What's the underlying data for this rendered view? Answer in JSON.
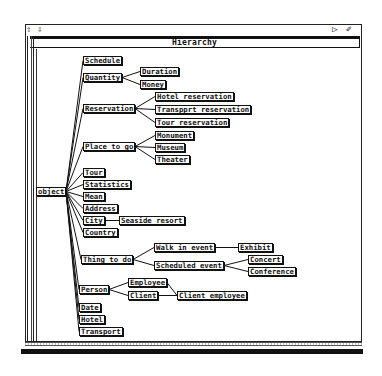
{
  "window": {
    "title": "Hierarchy",
    "top_icons": {
      "scroll_up": "up-arrow-icon",
      "scroll_down": "down-arrow-icon",
      "pointer": "pointer-icon",
      "pen": "pen-icon"
    }
  },
  "tree": {
    "root": "object",
    "nodes": [
      {
        "id": "object",
        "label": "object",
        "x": 36,
        "y": 187
      },
      {
        "id": "schedule",
        "label": "Schedule",
        "x": 83,
        "y": 56
      },
      {
        "id": "quantity",
        "label": "Quantity",
        "x": 83,
        "y": 73
      },
      {
        "id": "duration",
        "label": "Duration",
        "x": 140,
        "y": 67
      },
      {
        "id": "money",
        "label": "Money",
        "x": 140,
        "y": 80
      },
      {
        "id": "reservation",
        "label": "Reservation",
        "x": 83,
        "y": 104
      },
      {
        "id": "hotel_res",
        "label": "Hotel_reservation",
        "x": 155,
        "y": 92
      },
      {
        "id": "transport_res",
        "label": "Transpprt_reservation",
        "x": 155,
        "y": 105
      },
      {
        "id": "tour_res",
        "label": "Tour_reservation",
        "x": 155,
        "y": 118
      },
      {
        "id": "place_to_go",
        "label": "Place_to_go",
        "x": 83,
        "y": 142
      },
      {
        "id": "monument",
        "label": "Monument",
        "x": 155,
        "y": 131
      },
      {
        "id": "museum",
        "label": "Museum",
        "x": 155,
        "y": 143
      },
      {
        "id": "theater",
        "label": "Theater",
        "x": 155,
        "y": 155
      },
      {
        "id": "tour",
        "label": "Tour",
        "x": 83,
        "y": 168
      },
      {
        "id": "statistics",
        "label": "Statistics",
        "x": 83,
        "y": 180
      },
      {
        "id": "mean",
        "label": "Mean",
        "x": 83,
        "y": 192
      },
      {
        "id": "address",
        "label": "Address",
        "x": 83,
        "y": 204
      },
      {
        "id": "city",
        "label": "City",
        "x": 83,
        "y": 216
      },
      {
        "id": "seaside_resort",
        "label": "Seaside_resort",
        "x": 119,
        "y": 216
      },
      {
        "id": "country",
        "label": "Country",
        "x": 83,
        "y": 228
      },
      {
        "id": "thing_to_do",
        "label": "Thing_to_do",
        "x": 81,
        "y": 255
      },
      {
        "id": "walk_in_event",
        "label": "Walk_in_event",
        "x": 154,
        "y": 243
      },
      {
        "id": "exhibit",
        "label": "Exhibit",
        "x": 238,
        "y": 243
      },
      {
        "id": "scheduled_event",
        "label": "Scheduled_event",
        "x": 154,
        "y": 261
      },
      {
        "id": "concert",
        "label": "Concert",
        "x": 248,
        "y": 255
      },
      {
        "id": "conference",
        "label": "Conference",
        "x": 248,
        "y": 267
      },
      {
        "id": "person",
        "label": "Person",
        "x": 79,
        "y": 285
      },
      {
        "id": "employee",
        "label": "Employee",
        "x": 128,
        "y": 278
      },
      {
        "id": "client",
        "label": "Client",
        "x": 128,
        "y": 291
      },
      {
        "id": "client_employee",
        "label": "Client_employee",
        "x": 177,
        "y": 291
      },
      {
        "id": "date",
        "label": "Date",
        "x": 79,
        "y": 303
      },
      {
        "id": "hotel",
        "label": "Hotel",
        "x": 79,
        "y": 315
      },
      {
        "id": "transport",
        "label": "Transport",
        "x": 79,
        "y": 327
      }
    ],
    "edges": [
      [
        "object",
        "schedule"
      ],
      [
        "object",
        "quantity"
      ],
      [
        "object",
        "reservation"
      ],
      [
        "object",
        "place_to_go"
      ],
      [
        "object",
        "tour"
      ],
      [
        "object",
        "statistics"
      ],
      [
        "object",
        "mean"
      ],
      [
        "object",
        "address"
      ],
      [
        "object",
        "city"
      ],
      [
        "object",
        "country"
      ],
      [
        "object",
        "thing_to_do"
      ],
      [
        "object",
        "person"
      ],
      [
        "object",
        "date"
      ],
      [
        "object",
        "hotel"
      ],
      [
        "object",
        "transport"
      ],
      [
        "quantity",
        "duration"
      ],
      [
        "quantity",
        "money"
      ],
      [
        "reservation",
        "hotel_res"
      ],
      [
        "reservation",
        "transport_res"
      ],
      [
        "reservation",
        "tour_res"
      ],
      [
        "place_to_go",
        "monument"
      ],
      [
        "place_to_go",
        "museum"
      ],
      [
        "place_to_go",
        "theater"
      ],
      [
        "city",
        "seaside_resort"
      ],
      [
        "thing_to_do",
        "walk_in_event"
      ],
      [
        "thing_to_do",
        "scheduled_event"
      ],
      [
        "walk_in_event",
        "exhibit"
      ],
      [
        "scheduled_event",
        "concert"
      ],
      [
        "scheduled_event",
        "conference"
      ],
      [
        "person",
        "employee"
      ],
      [
        "person",
        "client"
      ],
      [
        "employee",
        "client_employee"
      ],
      [
        "client",
        "client_employee"
      ]
    ]
  }
}
